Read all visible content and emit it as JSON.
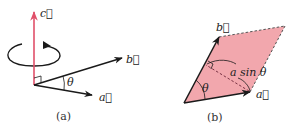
{
  "figure": {
    "panel_a": {
      "caption": "(a)",
      "labels": {
        "vector_c": "c⃗",
        "vector_b": "b⃗",
        "vector_a": "a⃗",
        "angle": "θ"
      },
      "colors": {
        "vector_c": "#e0506a",
        "vectors": "#1a1a1a"
      }
    },
    "panel_b": {
      "caption": "(b)",
      "labels": {
        "vector_b": "b⃗",
        "vector_a": "a⃗",
        "angle": "θ",
        "height": "a sin θ"
      },
      "colors": {
        "fill": "#f2a7ad",
        "vectors": "#1a1a1a"
      }
    }
  }
}
